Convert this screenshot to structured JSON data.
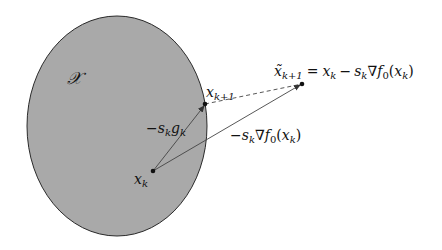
{
  "figure": {
    "set_label": "𝒳",
    "colors": {
      "set_fill": "#a9a9a9",
      "set_stroke": "#2a2a2a",
      "line": "#3a3a3a",
      "point": "#111111"
    },
    "points": {
      "xk": {
        "label_base": "x",
        "label_sub": "k"
      },
      "xk1": {
        "label_base": "x",
        "label_sub": "k+1"
      },
      "xtilde": {
        "label_base": "x̃",
        "label_sub": "k+1",
        "eq": "=",
        "rhs_x": "x",
        "rhs_x_sub": "k",
        "minus": "−",
        "s": "s",
        "s_sub": "k",
        "nabla": "∇",
        "f": "f",
        "f_sub": "0",
        "paren_open": "(",
        "arg_x": "x",
        "arg_sub": "k",
        "paren_close": ")"
      }
    },
    "vectors": {
      "projected_step": {
        "minus": "−",
        "s": "s",
        "s_sub": "k",
        "g": "g",
        "g_sub": "k"
      },
      "gradient_step": {
        "minus": "−",
        "s": "s",
        "s_sub": "k",
        "nabla": "∇",
        "f": "f",
        "f_sub": "0",
        "paren_open": "(",
        "arg_x": "x",
        "arg_sub": "k",
        "paren_close": ")"
      }
    }
  }
}
